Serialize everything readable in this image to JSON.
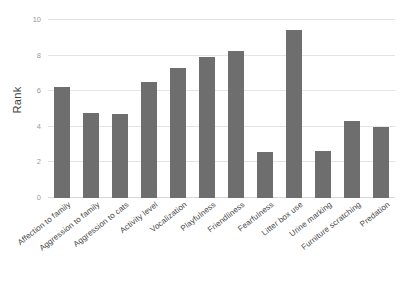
{
  "chart_data": {
    "type": "bar",
    "title": "",
    "subtitle": "",
    "xlabel": "",
    "ylabel": "Rank",
    "ylim": [
      0,
      10
    ],
    "yticks": [
      0,
      2,
      4,
      6,
      8,
      10
    ],
    "ytick_labels": [
      "0",
      "2",
      "4",
      "6",
      "8",
      "10"
    ],
    "grid": true,
    "legend": false,
    "legend_position": "none",
    "bar_color": "#6e6e6e",
    "gridline_color": "#e4e4e4",
    "background_color": "#ffffff",
    "categories": [
      "Affection to family",
      "Aggression to family",
      "Aggression to cats",
      "Activity level",
      "Vocalization",
      "Playfulness",
      "Friendliness",
      "Fearfulness",
      "Litter box use",
      "Urine marking",
      "Furniture scratching",
      "Predation"
    ],
    "values": [
      6.25,
      4.75,
      4.7,
      6.5,
      7.3,
      7.9,
      8.25,
      2.6,
      9.45,
      2.65,
      4.3,
      4.0
    ],
    "xtick_rotation_degrees": -38
  }
}
